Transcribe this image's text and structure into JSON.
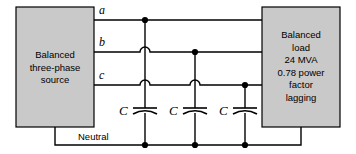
{
  "figure": {
    "colors": {
      "box_fill": "#c9c9c9",
      "box_stroke": "#000000",
      "wire": "#000000",
      "background": "#ffffff"
    }
  },
  "source_box": {
    "label": "Balanced\nthree-phase\nsource",
    "lines": [
      "Balanced",
      "three-phase",
      "source"
    ]
  },
  "load_box": {
    "label": "Balanced\nload\n24 MVA\n0.78 power\nfactor\nlagging",
    "lines": [
      "Balanced",
      "load",
      "24 MVA",
      "0.78 power",
      "factor",
      "lagging"
    ],
    "rating": "24 MVA",
    "power_factor": "0.78",
    "power_factor_type": "lagging"
  },
  "phases": {
    "a": "a",
    "b": "b",
    "c": "c"
  },
  "neutral": {
    "label": "Neutral"
  },
  "capacitors": [
    {
      "label": "C",
      "phase": "a"
    },
    {
      "label": "C",
      "phase": "b"
    },
    {
      "label": "C",
      "phase": "c"
    }
  ]
}
